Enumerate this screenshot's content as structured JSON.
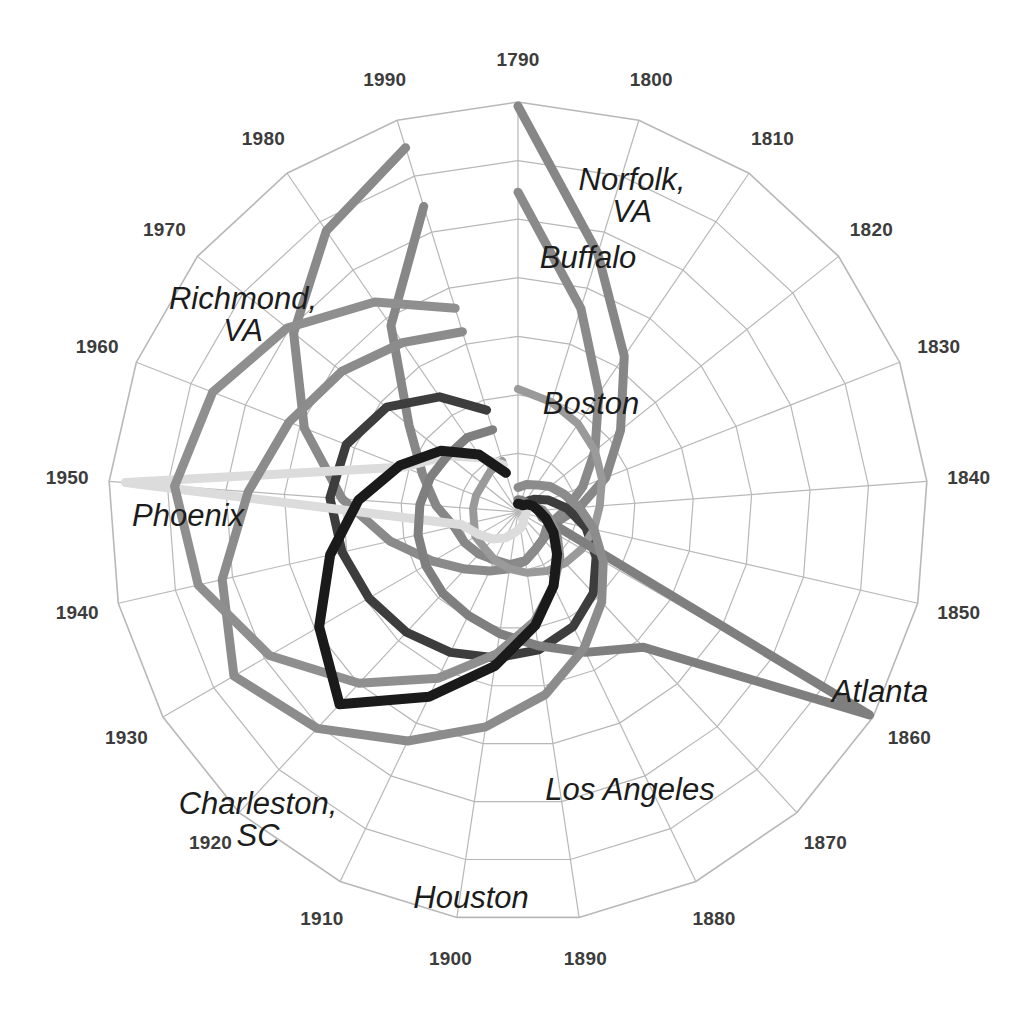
{
  "chart_data": {
    "type": "line",
    "subtype": "polar-spiral",
    "title": "",
    "xlabel": "",
    "ylabel": "",
    "angular_axis": {
      "name": "Census year",
      "direction": "clockwise",
      "start_angle_deg": 0,
      "tick_labels": [
        "1790",
        "1800",
        "1810",
        "1820",
        "1830",
        "1840",
        "1850",
        "1860",
        "1870",
        "1880",
        "1890",
        "1900",
        "1910",
        "1920",
        "1930",
        "1940",
        "1950",
        "1960",
        "1970",
        "1980",
        "1990"
      ]
    },
    "radial_axis": {
      "name": "Population rank (1 at center, larger outward)",
      "grid": true,
      "rings": 7,
      "rlim": [
        0,
        1
      ]
    },
    "legend": {
      "position": "inline-annotations"
    },
    "categories": [
      "1790",
      "1800",
      "1810",
      "1820",
      "1830",
      "1840",
      "1850",
      "1860",
      "1870",
      "1880",
      "1890",
      "1900",
      "1910",
      "1920",
      "1930",
      "1940",
      "1950",
      "1960",
      "1970",
      "1980",
      "1990"
    ],
    "series": [
      {
        "name": "Norfolk, VA",
        "color": "#878787",
        "width": 9,
        "label_pos": {
          "x": 632,
          "y": 196
        },
        "values": [
          0.99,
          0.66,
          0.46,
          0.32,
          0.23,
          0.15,
          0.1,
          0.09,
          0.09,
          0.1,
          0.12,
          0.13,
          0.13,
          0.14,
          0.15,
          0.16,
          0.2,
          0.25,
          0.34,
          0.55,
          0.78
        ]
      },
      {
        "name": "Richmond, VA",
        "color": "#8a8a8a",
        "width": 9,
        "label_pos": {
          "x": 243,
          "y": 315
        },
        "values": [
          0.78,
          0.52,
          0.35,
          0.24,
          0.17,
          0.12,
          0.09,
          0.08,
          0.09,
          0.1,
          0.12,
          0.14,
          0.16,
          0.19,
          0.24,
          0.32,
          0.43,
          0.56,
          0.7,
          0.83,
          0.93
        ]
      },
      {
        "name": "Buffalo",
        "color": "#3d3d3d",
        "width": 9,
        "label_pos": {
          "x": 588,
          "y": 258
        },
        "values": [
          0.02,
          0.02,
          0.03,
          0.05,
          0.08,
          0.12,
          0.17,
          0.22,
          0.27,
          0.31,
          0.34,
          0.36,
          0.38,
          0.4,
          0.42,
          0.44,
          0.46,
          0.45,
          0.41,
          0.34,
          0.26
        ]
      },
      {
        "name": "Boston",
        "color": "#9a9a9a",
        "width": 8,
        "label_pos": {
          "x": 591,
          "y": 404
        },
        "values": [
          0.3,
          0.28,
          0.26,
          0.24,
          0.22,
          0.2,
          0.19,
          0.18,
          0.17,
          0.16,
          0.15,
          0.14,
          0.13,
          0.12,
          0.12,
          0.11,
          0.11,
          0.11,
          0.11,
          0.12,
          0.13
        ]
      },
      {
        "name": "Phoenix",
        "color": "#dcdcdc",
        "width": 9,
        "label_pos": {
          "x": 188,
          "y": 516
        },
        "values": [
          0.02,
          0.02,
          0.02,
          0.02,
          0.02,
          0.02,
          0.02,
          0.02,
          0.02,
          0.03,
          0.04,
          0.05,
          0.07,
          0.09,
          0.11,
          0.14,
          0.96,
          0.3,
          0.22,
          0.16,
          0.12
        ]
      },
      {
        "name": "Atlanta",
        "color": "#7f7f7f",
        "width": 9,
        "label_pos": {
          "x": 880,
          "y": 692
        },
        "values": [
          0.03,
          0.03,
          0.03,
          0.03,
          0.04,
          0.05,
          0.06,
          0.99,
          0.45,
          0.38,
          0.33,
          0.3,
          0.28,
          0.27,
          0.26,
          0.25,
          0.24,
          0.23,
          0.22,
          0.22,
          0.21
        ]
      },
      {
        "name": "Charleston, SC",
        "color": "#8c8c8c",
        "width": 9,
        "label_pos": {
          "x": 258,
          "y": 820
        },
        "values": [
          0.06,
          0.07,
          0.08,
          0.1,
          0.12,
          0.15,
          0.19,
          0.24,
          0.3,
          0.37,
          0.45,
          0.53,
          0.62,
          0.72,
          0.8,
          0.74,
          0.66,
          0.6,
          0.55,
          0.5,
          0.46
        ]
      },
      {
        "name": "Houston",
        "color": "#8f8f8f",
        "width": 9,
        "label_pos": {
          "x": 471,
          "y": 898
        },
        "values": [
          0.02,
          0.02,
          0.02,
          0.03,
          0.04,
          0.06,
          0.08,
          0.11,
          0.15,
          0.2,
          0.27,
          0.35,
          0.45,
          0.57,
          0.7,
          0.8,
          0.84,
          0.8,
          0.72,
          0.62,
          0.52
        ]
      },
      {
        "name": "Los Angeles",
        "color": "#1a1a1a",
        "width": 10,
        "label_pos": {
          "x": 630,
          "y": 790
        },
        "values": [
          0.02,
          0.02,
          0.02,
          0.03,
          0.04,
          0.05,
          0.07,
          0.1,
          0.14,
          0.2,
          0.28,
          0.38,
          0.5,
          0.64,
          0.56,
          0.47,
          0.39,
          0.31,
          0.24,
          0.17,
          0.1
        ]
      }
    ],
    "annotations": [
      {
        "text": "Norfolk, VA"
      },
      {
        "text": "Buffalo"
      },
      {
        "text": "Richmond,\nVA"
      },
      {
        "text": "Boston"
      },
      {
        "text": "Phoenix"
      },
      {
        "text": "Atlanta"
      },
      {
        "text": "Charleston,\nSC"
      },
      {
        "text": "Houston"
      },
      {
        "text": "Los\nAngeles"
      }
    ]
  },
  "style": {
    "background": "#ffffff",
    "grid_color": "#b8b8b8",
    "tick_color": "#3c3c3c",
    "center": {
      "x": 518,
      "y": 512
    },
    "radius": 410
  }
}
